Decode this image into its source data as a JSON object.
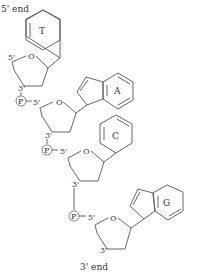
{
  "diagram": {
    "title_top": "5' end",
    "title_bottom": "3' end",
    "colors": {
      "line": "#555555",
      "text": "#333333",
      "background": "#ffffff"
    },
    "nucleotides": [
      {
        "base": "T",
        "sugar_oxygen": "O",
        "five_prime": "5'",
        "three_prime": "3'"
      },
      {
        "phosphate": "P",
        "base": "A",
        "sugar_oxygen": "O",
        "five_prime": "5'",
        "three_prime": "3'"
      },
      {
        "phosphate": "P",
        "base": "C",
        "sugar_oxygen": "O",
        "five_prime": "5'",
        "three_prime": "3'"
      },
      {
        "phosphate": "P",
        "base": "G",
        "sugar_oxygen": "O",
        "five_prime": "5'",
        "three_prime": "3'"
      }
    ]
  }
}
